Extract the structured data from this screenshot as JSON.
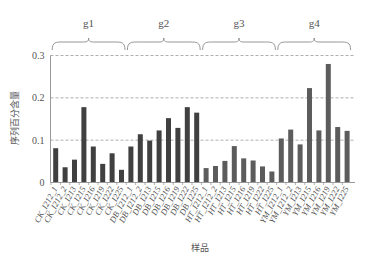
{
  "chart_data": {
    "type": "bar",
    "title": "",
    "xlabel": "样品",
    "ylabel": "序列百分含量",
    "ylim": [
      0,
      0.3
    ],
    "yticks": [
      0,
      0.1,
      0.2,
      0.3
    ],
    "ytick_labels": [
      "0",
      "0.1",
      "0.2",
      "0.3"
    ],
    "grid": "horizontal dashed",
    "groups": [
      {
        "name": "g1",
        "color": "#404040",
        "start": 0,
        "count": 8
      },
      {
        "name": "g2",
        "color": "#404040",
        "start": 8,
        "count": 8
      },
      {
        "name": "g3",
        "color": "#5c5c5c",
        "start": 16,
        "count": 8
      },
      {
        "name": "g4",
        "color": "#5c5c5c",
        "start": 24,
        "count": 8
      }
    ],
    "categories": [
      "CK_I212_1",
      "CK_I212_2",
      "CK_I213",
      "CK_I215",
      "CK_I216",
      "CK_I219",
      "CK_I222",
      "CK_I225",
      "DB_I212_1",
      "DB_I212_2",
      "DB_I213",
      "DB_I215",
      "DB_I216",
      "DB_I219",
      "DB_I222",
      "DB_I225",
      "HT_I212_1",
      "HT_I212_2",
      "HT_I213",
      "HT_I215",
      "HT_I216",
      "HT_I219",
      "HT_I222",
      "HT_I225",
      "YM_I212_1",
      "YM_I212_2",
      "YM_I213",
      "YM_I215",
      "YM_I216",
      "YM_I219",
      "YM_I222",
      "YM_I225"
    ],
    "values": [
      0.081,
      0.036,
      0.054,
      0.178,
      0.085,
      0.044,
      0.069,
      0.03,
      0.085,
      0.114,
      0.099,
      0.123,
      0.152,
      0.129,
      0.178,
      0.165,
      0.034,
      0.039,
      0.051,
      0.086,
      0.057,
      0.052,
      0.038,
      0.026,
      0.104,
      0.125,
      0.09,
      0.223,
      0.123,
      0.28,
      0.131,
      0.122
    ]
  }
}
